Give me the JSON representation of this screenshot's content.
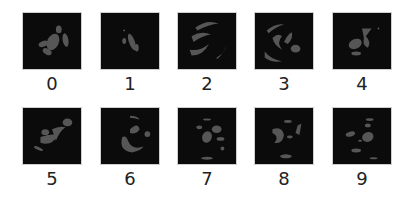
{
  "figure": {
    "background": "#ffffff",
    "tile_background": "#0b0b0b",
    "blob_color": "#565656",
    "samples": [
      {
        "label": "0",
        "class_index": 0
      },
      {
        "label": "1",
        "class_index": 1
      },
      {
        "label": "2",
        "class_index": 2
      },
      {
        "label": "3",
        "class_index": 3
      },
      {
        "label": "4",
        "class_index": 4
      },
      {
        "label": "5",
        "class_index": 5
      },
      {
        "label": "6",
        "class_index": 6
      },
      {
        "label": "7",
        "class_index": 7
      },
      {
        "label": "8",
        "class_index": 8
      },
      {
        "label": "9",
        "class_index": 9
      }
    ]
  }
}
